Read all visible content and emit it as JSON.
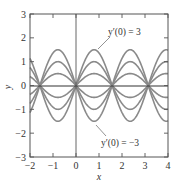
{
  "chart_data": {
    "type": "line",
    "title": "",
    "xlabel": "x",
    "ylabel": "y",
    "xlim": [
      -2,
      4
    ],
    "ylim": [
      -3,
      3
    ],
    "grid": false,
    "xticks": [
      -2,
      -1,
      0,
      1,
      2,
      3,
      4
    ],
    "yticks": [
      -3,
      -2,
      -1,
      0,
      1,
      2,
      3
    ],
    "xtick_labels": [
      "−2",
      "−1",
      "0",
      "1",
      "2",
      "3",
      "4"
    ],
    "ytick_labels": [
      "−3",
      "−2",
      "−1",
      "0",
      "1",
      "2",
      "3"
    ],
    "function": "y = (y'(0)/2) sin(2x)",
    "series": [
      {
        "name": "y'(0) = 3",
        "amplitude": 1.5
      },
      {
        "name": "y'(0) = 2",
        "amplitude": 1.0
      },
      {
        "name": "y'(0) = 1",
        "amplitude": 0.5
      },
      {
        "name": "y'(0) = 0",
        "amplitude": 0.0
      },
      {
        "name": "y'(0) = -1",
        "amplitude": -0.5
      },
      {
        "name": "y'(0) = -2",
        "amplitude": -1.0
      },
      {
        "name": "y'(0) = -3",
        "amplitude": -1.5
      }
    ],
    "annotations": [
      {
        "text": "y′(0) = 3",
        "points_to_series": "y'(0) = 3"
      },
      {
        "text": "y′(0) = −3",
        "points_to_series": "y'(0) = -3"
      }
    ],
    "colors": {
      "curve": "#8a8a8a",
      "axis": "#444444",
      "zero_line": "#333333"
    }
  }
}
